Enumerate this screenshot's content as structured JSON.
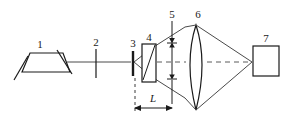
{
  "figure": {
    "type": "optical-system-schematic",
    "background_color": "#ffffff",
    "line_color": "#1a1a1a",
    "beam_color": "#4a4a4a"
  },
  "labels": {
    "item1": "1",
    "item2": "2",
    "item3": "3",
    "item4": "4",
    "item5": "5",
    "item6": "6",
    "item7": "7",
    "dimension_L": "L"
  },
  "components": [
    {
      "id": "1",
      "name": "trapezoid-source",
      "label": "1",
      "shape": "trapezoid"
    },
    {
      "id": "2",
      "name": "aperture-tick",
      "label": "2",
      "shape": "vertical-line"
    },
    {
      "id": "3",
      "name": "pinhole-bar",
      "label": "3",
      "shape": "thick-vertical-bar"
    },
    {
      "id": "4",
      "name": "crystal-block",
      "label": "4",
      "shape": "rectangle-with-diagonal"
    },
    {
      "id": "5",
      "name": "beam-height-dimension",
      "label": "5",
      "shape": "double-arrow-vertical"
    },
    {
      "id": "6",
      "name": "biconvex-lens",
      "label": "6",
      "shape": "lens"
    },
    {
      "id": "7",
      "name": "detector-box",
      "label": "7",
      "shape": "square"
    }
  ],
  "dimensions": [
    {
      "id": "L",
      "name": "distance-L",
      "label": "L",
      "orientation": "horizontal"
    }
  ]
}
